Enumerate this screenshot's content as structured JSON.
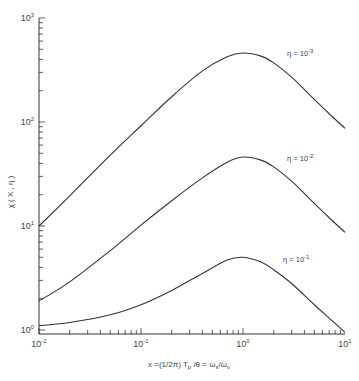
{
  "chart_data": {
    "type": "line",
    "title": "",
    "xlabel": "x = (1/2π) T_p/θ = ω_s/ω_ν",
    "ylabel": "χ(x, η)",
    "xscale": "log",
    "yscale": "log",
    "xlim": [
      0.01,
      10
    ],
    "ylim": [
      1,
      1000
    ],
    "grid": false,
    "x_ticks": [
      {
        "base": "10",
        "exp": "-2"
      },
      {
        "base": "10",
        "exp": "-1"
      },
      {
        "base": "10",
        "exp": "0"
      },
      {
        "base": "10",
        "exp": "1"
      }
    ],
    "y_ticks": [
      {
        "base": "10",
        "exp": "0"
      },
      {
        "base": "10",
        "exp": "1"
      },
      {
        "base": "10",
        "exp": "2"
      },
      {
        "base": "10",
        "exp": "3"
      }
    ],
    "x": [
      0.01,
      0.02,
      0.05,
      0.1,
      0.2,
      0.4,
      0.7,
      1.0,
      1.5,
      2.0,
      3.0,
      5.0,
      7.0,
      10.0
    ],
    "series": [
      {
        "name": "η = 10⁻³",
        "label_base": "η = 10",
        "label_exp": "-3",
        "values": [
          10,
          19.5,
          48,
          92,
          175,
          310,
          425,
          460,
          430,
          370,
          270,
          165,
          120,
          87
        ]
      },
      {
        "name": "η = 10⁻²",
        "label_base": "η = 10",
        "label_exp": "-2",
        "values": [
          1.9,
          2.9,
          5.8,
          10.2,
          17.5,
          29,
          41,
          46,
          43,
          37,
          27,
          16.5,
          12,
          8.7
        ]
      },
      {
        "name": "η = 10⁻¹",
        "label_base": "η = 10",
        "label_exp": "-1",
        "values": [
          1.1,
          1.18,
          1.4,
          1.75,
          2.4,
          3.5,
          4.7,
          5.0,
          4.5,
          3.8,
          2.8,
          1.75,
          1.3,
          0.95
        ]
      }
    ],
    "legend_position": "inline curve labels at right"
  },
  "axes": {
    "ylabel_text": "χ ( X , η )",
    "xlabel_text": "x =(1/2π) T",
    "xlabel_sub_p": "p",
    "xlabel_rest": " /θ  =  ω",
    "xlabel_sub_s": "s",
    "xlabel_slash": "/ω",
    "xlabel_sub_nu": "ν"
  }
}
